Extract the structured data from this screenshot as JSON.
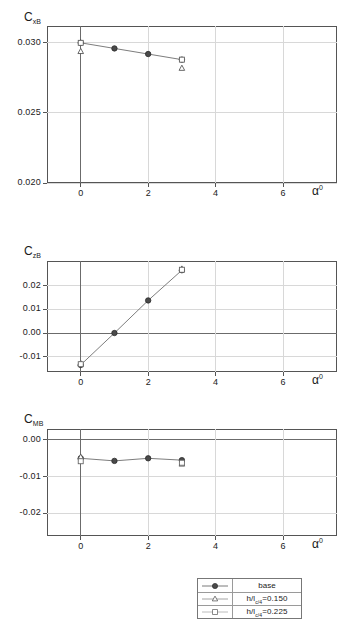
{
  "figure": {
    "x_axis_label": "α",
    "x_axis_label_sup": "0",
    "x_ticks": [
      "0",
      "2",
      "4",
      "6"
    ],
    "x_tick_values": [
      0,
      2,
      4,
      6
    ],
    "x_min": -1,
    "x_max": 7.6
  },
  "legend": {
    "items": [
      {
        "label": "base",
        "marker": "filled-circle",
        "marker_color": "#4a4a4a"
      },
      {
        "label_pre": "h/l",
        "label_sub": "c/4",
        "label_post": "=0.150",
        "label": "h/lc/4=0.150",
        "marker": "open-triangle",
        "marker_color": "#6b6b6b"
      },
      {
        "label_pre": "h/l",
        "label_sub": "c/4",
        "label_post": "=0.225",
        "label": "h/lc/4=0.225",
        "marker": "open-square",
        "marker_color": "#8a8a8a"
      }
    ]
  },
  "chart_data": [
    {
      "type": "line",
      "id": "cxb",
      "title": "",
      "ylabel": "C",
      "ylabel_sub": "xB",
      "xlabel": "α",
      "xlabel_sup": "0",
      "x": [
        0,
        1,
        2,
        3
      ],
      "ylim": [
        0.02,
        0.0312
      ],
      "yticks": [
        0.02,
        0.025,
        0.03
      ],
      "ytick_labels": [
        "0.020",
        "0.025",
        "0.030"
      ],
      "grid": true,
      "series": [
        {
          "name": "base",
          "marker": "filled-circle",
          "x": [
            0,
            1,
            2,
            3
          ],
          "values": [
            0.03,
            0.0296,
            0.0292,
            0.0288
          ]
        },
        {
          "name": "h/lc/4=0.150",
          "marker": "open-triangle",
          "x": [
            0,
            3
          ],
          "values": [
            0.0294,
            0.0282
          ]
        },
        {
          "name": "h/lc/4=0.225",
          "marker": "open-square",
          "x": [
            0,
            3
          ],
          "values": [
            0.03,
            0.0288
          ]
        }
      ]
    },
    {
      "type": "line",
      "id": "czb",
      "title": "",
      "ylabel": "C",
      "ylabel_sub": "zB",
      "xlabel": "α",
      "xlabel_sup": "0",
      "x": [
        0,
        1,
        2,
        3
      ],
      "ylim": [
        -0.0165,
        0.0305
      ],
      "yticks": [
        -0.01,
        0.0,
        0.01,
        0.02
      ],
      "ytick_labels": [
        "-0.01",
        "0.00",
        "0.01",
        "0.02"
      ],
      "grid": true,
      "zero_line": true,
      "series": [
        {
          "name": "base",
          "marker": "filled-circle",
          "x": [
            0,
            1,
            2,
            3
          ],
          "values": [
            -0.0135,
            0.0,
            0.0138,
            0.0266
          ]
        },
        {
          "name": "h/lc/4=0.150",
          "marker": "open-triangle",
          "x": [
            0,
            3
          ],
          "values": [
            -0.0128,
            0.0272
          ]
        },
        {
          "name": "h/lc/4=0.225",
          "marker": "open-square",
          "x": [
            0,
            3
          ],
          "values": [
            -0.0132,
            0.0268
          ]
        }
      ]
    },
    {
      "type": "line",
      "id": "cmb",
      "title": "",
      "ylabel": "C",
      "ylabel_sub": "MB",
      "xlabel": "α",
      "xlabel_sup": "0",
      "x": [
        0,
        1,
        2,
        3
      ],
      "ylim": [
        -0.0262,
        0.003
      ],
      "yticks": [
        -0.02,
        -0.01,
        0.0
      ],
      "ytick_labels": [
        "-0.02",
        "-0.01",
        "0.00"
      ],
      "grid": true,
      "zero_line": true,
      "series": [
        {
          "name": "base",
          "marker": "filled-circle",
          "x": [
            0,
            1,
            2,
            3
          ],
          "values": [
            -0.005,
            -0.0057,
            -0.005,
            -0.0055
          ]
        },
        {
          "name": "h/lc/4=0.150",
          "marker": "open-triangle",
          "x": [
            0,
            3
          ],
          "values": [
            -0.0046,
            -0.0065
          ]
        },
        {
          "name": "h/lc/4=0.225",
          "marker": "open-square",
          "x": [
            0,
            3
          ],
          "values": [
            -0.0058,
            -0.0062
          ]
        }
      ]
    }
  ]
}
